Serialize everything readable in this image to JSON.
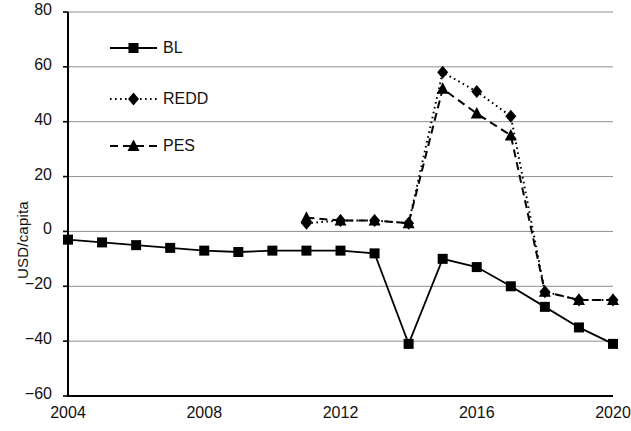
{
  "chart_data": {
    "type": "line",
    "title": "",
    "xlabel": "",
    "ylabel": "USD/capita",
    "xlim": [
      2004,
      2020
    ],
    "ylim": [
      -60,
      80
    ],
    "ytick_labels": [
      "80",
      "60",
      "40",
      "20",
      "0",
      "−20",
      "−40",
      "−60"
    ],
    "ytick_values": [
      80,
      60,
      40,
      20,
      0,
      -20,
      -40,
      -60
    ],
    "xtick_labels": [
      "2004",
      "2008",
      "2012",
      "2016",
      "2020"
    ],
    "xtick_values": [
      2004,
      2008,
      2012,
      2016,
      2020
    ],
    "grid": "horizontal",
    "legend_position": "upper-left-inside",
    "x": [
      2004,
      2005,
      2006,
      2007,
      2008,
      2009,
      2010,
      2011,
      2012,
      2013,
      2014,
      2015,
      2016,
      2017,
      2018,
      2019,
      2020
    ],
    "series": [
      {
        "name": "BL",
        "marker": "square",
        "line_style": "solid",
        "color": "#000000",
        "x": [
          2004,
          2005,
          2006,
          2007,
          2008,
          2009,
          2010,
          2011,
          2012,
          2013,
          2014,
          2015,
          2016,
          2017,
          2018,
          2019,
          2020
        ],
        "values": [
          -3,
          -4,
          -5,
          -6,
          -7,
          -7.5,
          -7,
          -7,
          -7,
          -8,
          -41,
          -10,
          -13,
          -20,
          -27.5,
          -35,
          -41
        ]
      },
      {
        "name": "REDD",
        "marker": "diamond",
        "line_style": "dotted",
        "color": "#000000",
        "x": [
          2011,
          2012,
          2013,
          2014,
          2015,
          2016,
          2017,
          2018,
          2019,
          2020
        ],
        "values": [
          3,
          4,
          4,
          3,
          58,
          51,
          42,
          -22,
          -25,
          -25
        ]
      },
      {
        "name": "PES",
        "marker": "triangle",
        "line_style": "dashed",
        "color": "#000000",
        "x": [
          2011,
          2012,
          2013,
          2014,
          2015,
          2016,
          2017,
          2018,
          2019,
          2020
        ],
        "values": [
          5,
          4,
          4,
          3,
          52,
          43,
          35,
          -22,
          -25,
          -25
        ]
      }
    ]
  },
  "legend": {
    "items": [
      {
        "label": "BL"
      },
      {
        "label": "REDD"
      },
      {
        "label": "PES"
      }
    ]
  },
  "axes": {
    "y_title": "USD/capita"
  }
}
